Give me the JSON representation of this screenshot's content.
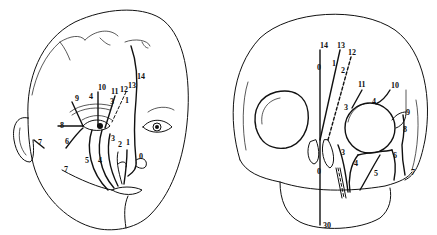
{
  "figure": {
    "panels": [
      {
        "id": "face",
        "description": "Frontal oblique view of infant face showing facial cleft lines",
        "labels": [
          {
            "text": "14",
            "x": 137,
            "y": 79
          },
          {
            "text": "13",
            "x": 128,
            "y": 88
          },
          {
            "text": "12",
            "x": 120,
            "y": 92
          },
          {
            "text": "11",
            "x": 111,
            "y": 94
          },
          {
            "text": "10",
            "x": 98,
            "y": 90
          },
          {
            "text": "9",
            "x": 75,
            "y": 101
          },
          {
            "text": "4",
            "x": 89,
            "y": 99
          },
          {
            "text": "3",
            "x": 110,
            "y": 104
          },
          {
            "text": "1",
            "x": 125,
            "y": 103
          },
          {
            "text": "8",
            "x": 60,
            "y": 128
          },
          {
            "text": "6",
            "x": 65,
            "y": 144
          },
          {
            "text": "7",
            "x": 38,
            "y": 145
          },
          {
            "text": "7",
            "x": 64,
            "y": 172
          },
          {
            "text": "3",
            "x": 111,
            "y": 141
          },
          {
            "text": "2",
            "x": 118,
            "y": 147
          },
          {
            "text": "1",
            "x": 126,
            "y": 145
          },
          {
            "text": "5",
            "x": 85,
            "y": 163
          },
          {
            "text": "4",
            "x": 98,
            "y": 163
          },
          {
            "text": "0",
            "x": 139,
            "y": 159
          }
        ]
      },
      {
        "id": "skull",
        "description": "Frontal view of infant skull showing cleft lines",
        "labels": [
          {
            "text": "14",
            "x": 100,
            "y": 48
          },
          {
            "text": "13",
            "x": 117,
            "y": 48
          },
          {
            "text": "12",
            "x": 128,
            "y": 55
          },
          {
            "text": "0",
            "x": 97,
            "y": 70
          },
          {
            "text": "1",
            "x": 112,
            "y": 66
          },
          {
            "text": "2",
            "x": 121,
            "y": 73
          },
          {
            "text": "11",
            "x": 138,
            "y": 87
          },
          {
            "text": "10",
            "x": 171,
            "y": 88
          },
          {
            "text": "4",
            "x": 152,
            "y": 104
          },
          {
            "text": "3",
            "x": 124,
            "y": 110
          },
          {
            "text": "9",
            "x": 186,
            "y": 115
          },
          {
            "text": "8",
            "x": 183,
            "y": 132
          },
          {
            "text": "3",
            "x": 121,
            "y": 155
          },
          {
            "text": "4",
            "x": 134,
            "y": 166
          },
          {
            "text": "6",
            "x": 173,
            "y": 158
          },
          {
            "text": "5",
            "x": 154,
            "y": 176
          },
          {
            "text": "7",
            "x": 191,
            "y": 175
          },
          {
            "text": "0",
            "x": 97,
            "y": 174
          },
          {
            "text": "30",
            "x": 103,
            "y": 228
          }
        ]
      }
    ]
  }
}
